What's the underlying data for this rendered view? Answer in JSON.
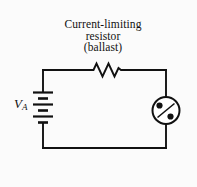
{
  "figure": {
    "type": "schematic-circuit-diagram",
    "background_color": "#fbfbfb",
    "ink_color": "#111111",
    "width": 197,
    "height": 187
  },
  "caption": {
    "line1": "Current-limiting",
    "line2": "resistor",
    "line3": "(ballast)"
  },
  "source": {
    "symbol": "battery",
    "label_main": "V",
    "label_subscript": "A"
  },
  "components": [
    {
      "name": "resistor",
      "symbol": "zigzag",
      "label": "Current-limiting resistor (ballast)"
    },
    {
      "name": "voltage-source",
      "symbol": "battery",
      "label": "V_A"
    },
    {
      "name": "discharge-lamp",
      "symbol": "circle-with-two-electrodes",
      "label": ""
    }
  ],
  "wires": {
    "top_label": "top wire",
    "bottom_label": "bottom wire",
    "left_label": "left wire",
    "right_label": "right wire"
  }
}
